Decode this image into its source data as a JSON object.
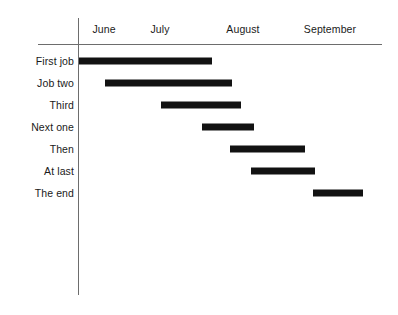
{
  "chart_data": {
    "type": "bar",
    "subtype": "gantt",
    "title": "",
    "xlabel": "",
    "ylabel": "",
    "grid": false,
    "legend": null,
    "orientation": "horizontal",
    "axis": {
      "months": [
        "June",
        "July",
        "August",
        "September"
      ],
      "month_centers_px": [
        104,
        160,
        243,
        330
      ],
      "month_width_px": 56,
      "origin_x_px": 78,
      "range_start": "June",
      "range_end": "September"
    },
    "categories": [
      "First job",
      "Job two",
      "Third",
      "Next one",
      "Then",
      "At last",
      "The end"
    ],
    "bars": [
      {
        "label": "First job",
        "start_month": 0.0,
        "end_month": 2.4,
        "start_px": 79,
        "end_px": 212,
        "row_y_px": 61
      },
      {
        "label": "Job two",
        "start_month": 0.48,
        "end_month": 2.75,
        "start_px": 105,
        "end_px": 232,
        "row_y_px": 83
      },
      {
        "label": "Third",
        "start_month": 1.48,
        "end_month": 2.91,
        "start_px": 161,
        "end_px": 241,
        "row_y_px": 105
      },
      {
        "label": "Next one",
        "start_month": 2.21,
        "end_month": 3.14,
        "start_px": 202,
        "end_px": 254,
        "row_y_px": 127
      },
      {
        "label": "Then",
        "start_month": 2.71,
        "end_month": 4.05,
        "start_px": 230,
        "end_px": 305,
        "row_y_px": 149
      },
      {
        "label": "At last",
        "start_month": 3.09,
        "end_month": 4.23,
        "start_px": 251,
        "end_px": 315,
        "row_y_px": 171
      },
      {
        "label": "The end",
        "start_month": 4.2,
        "end_month": 5.09,
        "start_px": 313,
        "end_px": 363,
        "row_y_px": 193
      }
    ],
    "colors": {
      "bar": "#121212",
      "axis": "#6d6d6d",
      "text": "#1a1a1a",
      "background": "#ffffff"
    }
  }
}
